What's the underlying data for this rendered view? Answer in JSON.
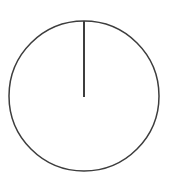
{
  "figure": {
    "name": "single-slice-pie-chart",
    "background_color": "#ffffff",
    "width": 170,
    "height": 190,
    "title": "",
    "subtitle": "",
    "caption": ""
  },
  "geometry": {
    "center_x": 84,
    "center_y": 96,
    "radius": 75,
    "outline_color": "#3d3d3d",
    "outline_width": 1.5,
    "fill_color": "#ffffff",
    "divider_color": "#3d3d3d",
    "divider_width": 2,
    "divider_start_angle_deg": 90,
    "divider_x": 84,
    "divider_y_top": 21,
    "divider_y_bottom": 97
  },
  "chart_data": {
    "type": "pie",
    "title": "",
    "xlabel": "",
    "ylabel": "",
    "labels": [
      "Slice 1"
    ],
    "values": [
      100
    ],
    "percentages": [
      "100%"
    ],
    "colors": [
      "#ffffff"
    ],
    "edge_color": "#3d3d3d",
    "start_angle_deg": 90,
    "counterclock": true,
    "show_labels": false,
    "show_percent_labels": false,
    "legend": false,
    "legend_position": "none",
    "grid": false,
    "annotations": []
  }
}
